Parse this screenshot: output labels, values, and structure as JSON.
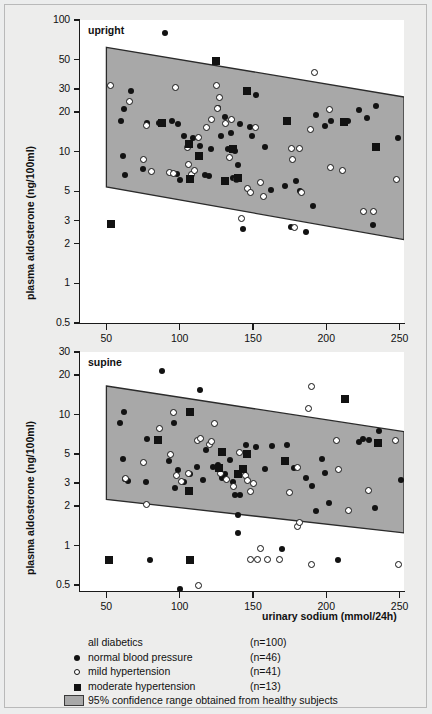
{
  "figure": {
    "y_axis_title": "plasma aldosterone (ng/100ml)",
    "x_axis_title": "urinary sodium (mmol/24h)"
  },
  "legend": {
    "rows": [
      {
        "marker": "none",
        "label": "all diabetics",
        "n": "(n=100)"
      },
      {
        "marker": "closed",
        "label": "normal blood pressure",
        "n": "(n=46)"
      },
      {
        "marker": "open",
        "label": "mild hypertension",
        "n": "(n=41)"
      },
      {
        "marker": "square",
        "label": "moderate hypertension",
        "n": "(n=13)"
      }
    ],
    "band_note": "95% confidence range obtained from healthy subjects",
    "band_color": "#a8a8a8"
  },
  "chart_data": [
    {
      "type": "scatter",
      "title": "upright",
      "xlabel": "urinary sodium (mmol/24h)",
      "ylabel": "plasma aldosterone (ng/100ml)",
      "yscale": "log",
      "ylim": [
        0.5,
        100
      ],
      "yticks": [
        100,
        50,
        30,
        20,
        10,
        5,
        3,
        2,
        1,
        0.5
      ],
      "ytick_labels": [
        "100",
        "50",
        "30",
        "20",
        "10",
        "5",
        "3",
        "2",
        "1",
        "0.5"
      ],
      "xlim": [
        32,
        253
      ],
      "xticks": [
        50,
        100,
        150,
        200,
        250
      ],
      "xtick_labels": [
        "50",
        "100",
        "150",
        "200",
        "250"
      ],
      "grid": false,
      "legend_position": "below-figure",
      "band": {
        "label": "95% confidence range obtained from healthy subjects",
        "x_start": 50,
        "x_end": 253,
        "upper_start": 62,
        "upper_end": 26,
        "lower_start": 5.4,
        "lower_end": 2.15
      },
      "series": [
        {
          "name": "normal blood pressure",
          "marker": "closed-circle",
          "points": [
            [
              90,
              80
            ],
            [
              67,
              29
            ],
            [
              62,
              21
            ],
            [
              60,
              17
            ],
            [
              78,
              16.5
            ],
            [
              86,
              16.6
            ],
            [
              95,
              17
            ],
            [
              99,
              16.3
            ],
            [
              61,
              9.3
            ],
            [
              63,
              6.6
            ],
            [
              75,
              7.4
            ],
            [
              98,
              6.8
            ],
            [
              100,
              6.1
            ],
            [
              103,
              13.2
            ],
            [
              109,
              12.8
            ],
            [
              114,
              11.0
            ],
            [
              121,
              10.4
            ],
            [
              117,
              6.6
            ],
            [
              120,
              6.5
            ],
            [
              126,
              21.5
            ],
            [
              131,
              18.5
            ],
            [
              128,
              13.2
            ],
            [
              133,
              10.5
            ],
            [
              135,
              13.8
            ],
            [
              138,
              10.1
            ],
            [
              136,
              6.3
            ],
            [
              140,
              7.9
            ],
            [
              143,
              2.6
            ],
            [
              148,
              15.5
            ],
            [
              149,
              13.2
            ],
            [
              152,
              27
            ],
            [
              158,
              10.8
            ],
            [
              162,
              5.1
            ],
            [
              172,
              5.5
            ],
            [
              176,
              2.7
            ],
            [
              179,
              6.0
            ],
            [
              182,
              5.0
            ],
            [
              186,
              2.45
            ],
            [
              193,
              19
            ],
            [
              199,
              15.8
            ],
            [
              203,
              17.2
            ],
            [
              215,
              17.0
            ],
            [
              222,
              20.6
            ],
            [
              228,
              18.0
            ],
            [
              232,
              2.8
            ],
            [
              234,
              22.2
            ],
            [
              249,
              12.8
            ],
            [
              191,
              3.9
            ],
            [
              141,
              16.2
            ]
          ]
        },
        {
          "name": "mild hypertension",
          "marker": "open-circle",
          "points": [
            [
              53,
              32
            ],
            [
              66,
              24
            ],
            [
              77,
              15.8
            ],
            [
              75,
              8.8
            ],
            [
              81,
              7.1
            ],
            [
              93,
              6.9
            ],
            [
              97,
              31
            ],
            [
              105,
              10.8
            ],
            [
              106,
              8.0
            ],
            [
              108,
              6.7
            ],
            [
              110,
              7.2
            ],
            [
              113,
              12.8
            ],
            [
              118,
              15.4
            ],
            [
              122,
              17.6
            ],
            [
              125,
              32
            ],
            [
              127,
              26
            ],
            [
              126,
              21.2
            ],
            [
              131,
              16.4
            ],
            [
              135,
              17.5
            ],
            [
              134,
              9.0
            ],
            [
              139,
              6.2
            ],
            [
              142,
              3.1
            ],
            [
              146,
              5.3
            ],
            [
              148,
              4.9
            ],
            [
              152,
              15.4
            ],
            [
              155,
              5.8
            ],
            [
              157,
              4.6
            ],
            [
              176,
              10.6
            ],
            [
              177,
              8.8
            ],
            [
              178,
              2.65
            ],
            [
              182,
              10.6
            ],
            [
              183,
              4.9
            ],
            [
              189,
              14.8
            ],
            [
              192,
              40
            ],
            [
              202,
              20.8
            ],
            [
              203,
              7.6
            ],
            [
              211,
              7.2
            ],
            [
              225,
              3.5
            ],
            [
              232,
              3.5
            ],
            [
              248,
              6.1
            ],
            [
              96,
              6.8
            ]
          ]
        },
        {
          "name": "moderate hypertension",
          "marker": "filled-square",
          "points": [
            [
              53,
              2.85
            ],
            [
              88,
              16.6
            ],
            [
              106,
              11.5
            ],
            [
              107,
              6.2
            ],
            [
              113,
              9.3
            ],
            [
              125,
              49
            ],
            [
              131,
              6.0
            ],
            [
              136,
              10.4
            ],
            [
              140,
              6.3
            ],
            [
              146,
              29
            ],
            [
              173,
              17.2
            ],
            [
              212,
              16.8
            ],
            [
              234,
              10.8
            ]
          ]
        }
      ]
    },
    {
      "type": "scatter",
      "title": "supine",
      "xlabel": "urinary sodium (mmol/24h)",
      "ylabel": "plasma aldosterone (ng/100ml)",
      "yscale": "log",
      "ylim": [
        0.45,
        30
      ],
      "yticks": [
        30,
        20,
        10,
        5,
        3,
        2,
        1,
        0.5
      ],
      "ytick_labels": [
        "30",
        "20",
        "10",
        "5",
        "3",
        "2",
        "1",
        "0.5"
      ],
      "xlim": [
        32,
        253
      ],
      "xticks": [
        50,
        100,
        150,
        200,
        250
      ],
      "xtick_labels": [
        "50",
        "100",
        "150",
        "200",
        "250"
      ],
      "grid": false,
      "legend_position": "below-figure",
      "band": {
        "label": "95% confidence range obtained from healthy subjects",
        "x_start": 50,
        "x_end": 253,
        "upper_start": 16.5,
        "upper_end": 7.4,
        "lower_start": 2.25,
        "lower_end": 1.25
      },
      "series": [
        {
          "name": "normal blood pressure",
          "marker": "closed-circle",
          "points": [
            [
              88,
              21.5
            ],
            [
              114,
              15.5
            ],
            [
              62,
              10.4
            ],
            [
              59,
              8.6
            ],
            [
              96,
              8.6
            ],
            [
              78,
              6.5
            ],
            [
              61,
              4.6
            ],
            [
              93,
              4.4
            ],
            [
              99,
              3.8
            ],
            [
              65,
              3.1
            ],
            [
              77,
              3.05
            ],
            [
              63,
              3.25
            ],
            [
              97,
              2.75
            ],
            [
              103,
              3.05
            ],
            [
              107,
              3.5
            ],
            [
              112,
              3.95
            ],
            [
              118,
              5.4
            ],
            [
              116,
              3.15
            ],
            [
              123,
              4.0
            ],
            [
              126,
              4.1
            ],
            [
              131,
              3.5
            ],
            [
              134,
              4.5
            ],
            [
              136,
              3.05
            ],
            [
              138,
              2.45
            ],
            [
              141,
              2.45
            ],
            [
              140,
              1.7
            ],
            [
              140,
              1.25
            ],
            [
              145,
              5.9
            ],
            [
              152,
              5.7
            ],
            [
              158,
              3.85
            ],
            [
              163,
              5.8
            ],
            [
              170,
              0.95
            ],
            [
              173,
              5.9
            ],
            [
              178,
              3.9
            ],
            [
              186,
              3.3
            ],
            [
              190,
              2.85
            ],
            [
              193,
              1.85
            ],
            [
              197,
              4.6
            ],
            [
              199,
              3.6
            ],
            [
              202,
              2.1
            ],
            [
              208,
              0.78
            ],
            [
              222,
              6.2
            ],
            [
              225,
              6.5
            ],
            [
              229,
              6.4
            ],
            [
              233,
              1.95
            ],
            [
              236,
              7.5
            ],
            [
              251,
              3.15
            ],
            [
              80,
              0.78
            ],
            [
              100,
              0.47
            ],
            [
              129,
              3.3
            ]
          ]
        },
        {
          "name": "mild hypertension",
          "marker": "open-circle",
          "points": [
            [
              86,
              7.8
            ],
            [
              96,
              10.4
            ],
            [
              63,
              3.25
            ],
            [
              75,
              4.3
            ],
            [
              94,
              4.95
            ],
            [
              98,
              3.45
            ],
            [
              101,
              3.1
            ],
            [
              106,
              3.55
            ],
            [
              112,
              6.3
            ],
            [
              114,
              6.6
            ],
            [
              120,
              5.9
            ],
            [
              122,
              6.2
            ],
            [
              124,
              8.6
            ],
            [
              128,
              3.55
            ],
            [
              132,
              3.2
            ],
            [
              137,
              2.85
            ],
            [
              141,
              5.1
            ],
            [
              145,
              3.4
            ],
            [
              146,
              3.15
            ],
            [
              148,
              2.6
            ],
            [
              150,
              3.0
            ],
            [
              155,
              0.95
            ],
            [
              148,
              0.78
            ],
            [
              153,
              0.78
            ],
            [
              160,
              0.78
            ],
            [
              168,
              0.78
            ],
            [
              175,
              2.55
            ],
            [
              180,
              1.4
            ],
            [
              182,
              1.5
            ],
            [
              180,
              3.95
            ],
            [
              188,
              11.2
            ],
            [
              190,
              16.3
            ],
            [
              190,
              0.72
            ],
            [
              208,
              3.8
            ],
            [
              207,
              6.3
            ],
            [
              215,
              1.85
            ],
            [
              229,
              2.65
            ],
            [
              247,
              6.3
            ],
            [
              249,
              0.72
            ],
            [
              77,
              2.05
            ],
            [
              113,
              0.5
            ]
          ]
        },
        {
          "name": "moderate hypertension",
          "marker": "filled-square",
          "points": [
            [
              85,
              6.4
            ],
            [
              107,
              10.4
            ],
            [
              106,
              2.6
            ],
            [
              129,
              5.2
            ],
            [
              127,
              3.9
            ],
            [
              143,
              3.85
            ],
            [
              146,
              5.0
            ],
            [
              172,
              4.4
            ],
            [
              213,
              13.2
            ],
            [
              235,
              6.1
            ],
            [
              52,
              0.78
            ],
            [
              107,
              0.78
            ],
            [
              140,
              3.55
            ]
          ]
        }
      ]
    }
  ]
}
